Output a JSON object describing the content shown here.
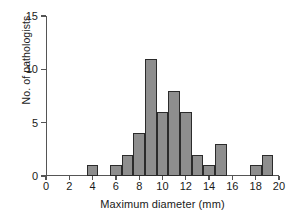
{
  "chart_data": {
    "type": "bar",
    "title": "",
    "subtitle": "",
    "xlabel": "Maximum diameter (mm)",
    "ylabel": "No. of pathologists",
    "xlim": [
      0,
      20
    ],
    "ylim": [
      0,
      15
    ],
    "grid": false,
    "legend": null,
    "bin_width": 1,
    "note": "Histogram of maximum diameter measurements; bars are 1 mm wide bins centred on the listed x value.",
    "categories": [
      4,
      6,
      7,
      8,
      9,
      10,
      11,
      12,
      13,
      14,
      15,
      18,
      19
    ],
    "values": [
      1,
      1,
      2,
      4,
      11,
      6,
      8,
      6,
      2,
      1,
      3,
      1,
      2
    ],
    "bars": [
      {
        "center": 4,
        "x0": 3.5,
        "x1": 4.5,
        "count": 1
      },
      {
        "center": 6,
        "x0": 5.5,
        "x1": 6.5,
        "count": 1
      },
      {
        "center": 7,
        "x0": 6.5,
        "x1": 7.5,
        "count": 2
      },
      {
        "center": 8,
        "x0": 7.5,
        "x1": 8.5,
        "count": 4
      },
      {
        "center": 9,
        "x0": 8.5,
        "x1": 9.5,
        "count": 11
      },
      {
        "center": 10,
        "x0": 9.5,
        "x1": 10.5,
        "count": 6
      },
      {
        "center": 11,
        "x0": 10.5,
        "x1": 11.5,
        "count": 8
      },
      {
        "center": 12,
        "x0": 11.5,
        "x1": 12.5,
        "count": 6
      },
      {
        "center": 13,
        "x0": 12.5,
        "x1": 13.5,
        "count": 2
      },
      {
        "center": 14,
        "x0": 13.5,
        "x1": 14.5,
        "count": 1
      },
      {
        "center": 15,
        "x0": 14.5,
        "x1": 15.5,
        "count": 3
      },
      {
        "center": 18,
        "x0": 17.5,
        "x1": 18.5,
        "count": 1
      },
      {
        "center": 19,
        "x0": 18.5,
        "x1": 19.5,
        "count": 2
      }
    ],
    "xticks": [
      0,
      2,
      4,
      6,
      8,
      10,
      12,
      14,
      16,
      18,
      20
    ],
    "xtick_labels": [
      "0",
      "2",
      "4",
      "6",
      "8",
      "10",
      "12",
      "14",
      "16",
      "18",
      "20"
    ],
    "yticks": [
      0,
      5,
      10,
      15
    ],
    "ytick_labels": [
      "0",
      "5",
      "10",
      "15"
    ],
    "colors": {
      "bar_fill": "#8e8e8e",
      "bar_edge": "#2b2b2b",
      "axis": "#555555",
      "text": "#1a1a1a",
      "background": "#ffffff"
    }
  }
}
